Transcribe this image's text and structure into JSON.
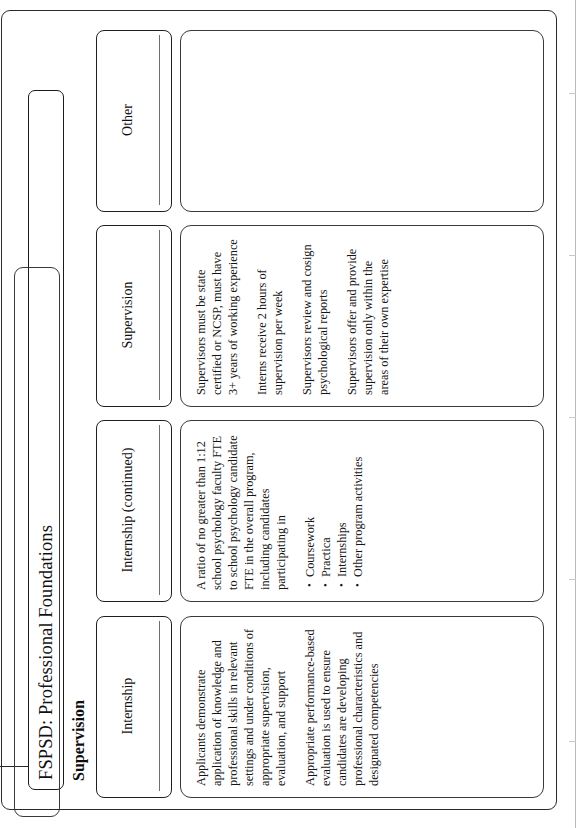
{
  "document": {
    "title": "FSPSD: Professional Foundations",
    "section_heading": "Supervision"
  },
  "table": {
    "columns": [
      {
        "header": "Internship",
        "blocks": [
          {
            "type": "paragraph",
            "text": "Applicants demonstrate application of knowledge and professional skills in relevant settings and under conditions of appropriate supervision, evaluation, and support"
          },
          {
            "type": "paragraph",
            "text": "Appropriate performance-based evaluation is used to ensure candidates are developing professional characteristics and designated competencies"
          }
        ]
      },
      {
        "header": "Internship (continued)",
        "blocks": [
          {
            "type": "paragraph",
            "text": "A ratio of no greater than 1:12 school psychology faculty FTE to school psychology candidate FTE in the overall program, including candidates participating in"
          },
          {
            "type": "bullets",
            "items": [
              "Coursework",
              "Practica",
              "Internships",
              "Other program activities"
            ]
          }
        ]
      },
      {
        "header": "Supervision",
        "blocks": [
          {
            "type": "paragraph",
            "text": "Supervisors must be state certified or NCSP, must have 3+ years of working experience"
          },
          {
            "type": "paragraph",
            "text": "Interns receive 2 hours of supervision per week"
          },
          {
            "type": "paragraph",
            "text": "Supervisors review and cosign psychological reports"
          },
          {
            "type": "paragraph",
            "text": "Supervisors offer and provide supervision only within the areas of their own expertise"
          }
        ]
      },
      {
        "header": "Other",
        "blocks": []
      }
    ]
  }
}
